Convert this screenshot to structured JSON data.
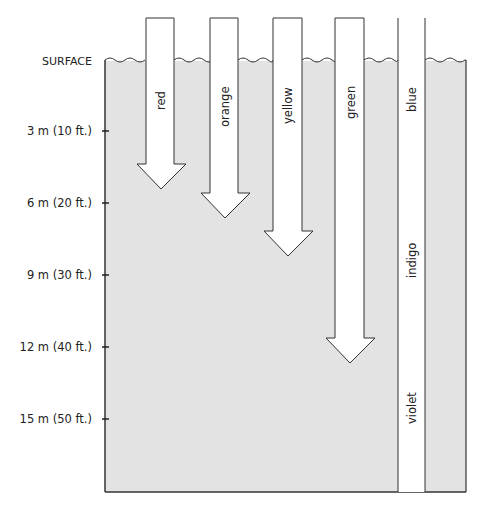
{
  "diagram": {
    "surface_label": "SURFACE",
    "depth_labels": [
      {
        "text": "3 m (10 ft.)",
        "y": 130
      },
      {
        "text": "6 m (20 ft.)",
        "y": 203
      },
      {
        "text": "9 m (30 ft.)",
        "y": 275
      },
      {
        "text": "12 m (40 ft.)",
        "y": 347
      },
      {
        "text": "15 m (50 ft.)",
        "y": 419
      }
    ],
    "colors": [
      {
        "name": "red",
        "label": "red",
        "depth": "~4.5 m (15 ft.)"
      },
      {
        "name": "orange",
        "label": "orange",
        "depth": "~6 m (20 ft.)"
      },
      {
        "name": "yellow",
        "label": "yellow",
        "depth": "~7.5 m (25 ft.)"
      },
      {
        "name": "green",
        "label": "green",
        "depth": "~12 m (40 ft.)"
      },
      {
        "name": "blue",
        "label": "blue",
        "depth": "beyond 15 m (50 ft.)"
      }
    ],
    "blue_column_extra_labels": [
      "indigo",
      "violet"
    ],
    "water_color": "#e3e3e3",
    "line_color": "#333333"
  }
}
